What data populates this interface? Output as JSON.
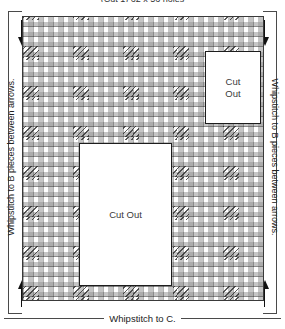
{
  "diagram": {
    "top_caption": "(Cut 1) 62 x 56 holes",
    "bottom_caption": "Whipstitch to C.",
    "left_caption": "Whipstitch to B pieces between arrows.",
    "right_caption": "Whipstitch to B pieces between arrows.",
    "colors": {
      "outline": "#1d1d1d",
      "mesh": "#969696",
      "stitch": "#282828",
      "background": "#ffffff",
      "text": "#222222"
    },
    "cutouts": [
      {
        "id": "cutout-small",
        "label": "Cut\nOut"
      },
      {
        "id": "cutout-large",
        "label": "Cut Out"
      }
    ],
    "arrows": [
      {
        "id": "arrow-top-left",
        "direction": "down"
      },
      {
        "id": "arrow-top-right",
        "direction": "down"
      },
      {
        "id": "arrow-bottom-left",
        "direction": "up"
      },
      {
        "id": "arrow-bottom-right",
        "direction": "up"
      }
    ]
  }
}
